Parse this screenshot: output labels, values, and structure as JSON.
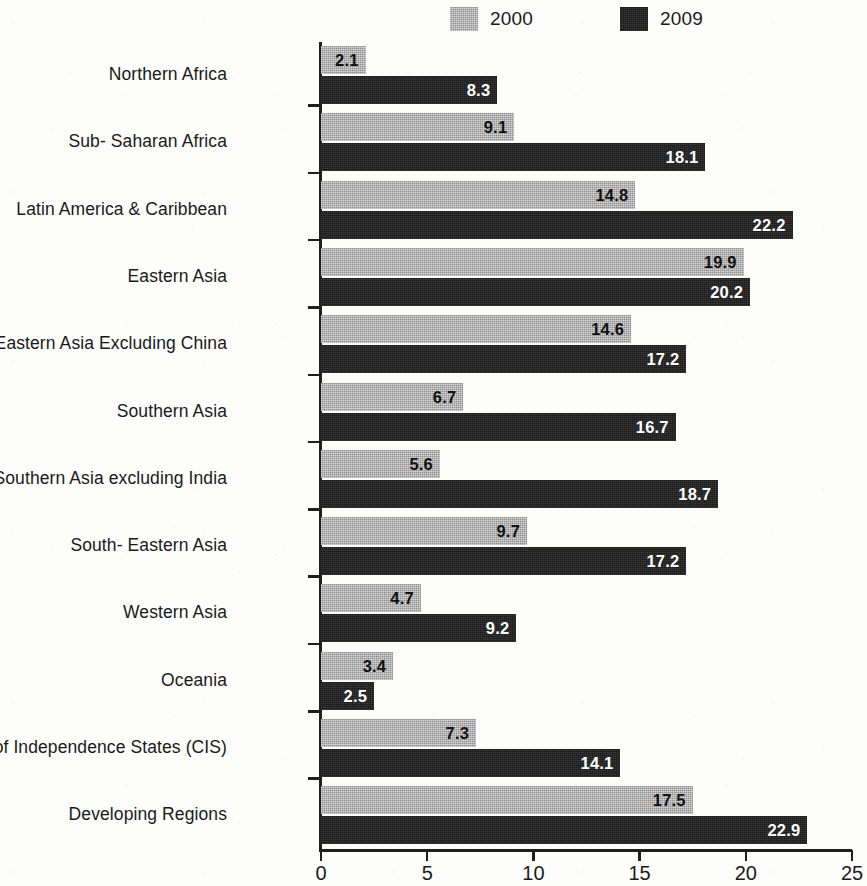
{
  "legend": {
    "items": [
      {
        "label": "2000",
        "color": "#8e8e8e",
        "key": "s2000"
      },
      {
        "label": "2009",
        "color": "#1b1b1b",
        "key": "s2009"
      }
    ]
  },
  "axis": {
    "x_ticks": [
      "0",
      "5",
      "10",
      "15",
      "20",
      "25"
    ]
  },
  "chart_data": {
    "type": "bar",
    "orientation": "horizontal",
    "title": "",
    "subtitle": "",
    "xlabel": "",
    "ylabel": "",
    "xlim": [
      0,
      25
    ],
    "xticks": [
      0,
      5,
      10,
      15,
      20,
      25
    ],
    "grid": false,
    "legend_position": "top",
    "categories": [
      "Northern Africa",
      "Sub- Saharan Africa",
      "Latin America & Caribbean",
      "Eastern Asia",
      "Eastern Asia Excluding China",
      "Southern Asia",
      "Southern Asia excluding India",
      "South- Eastern Asia",
      "Western Asia",
      "Oceania",
      "Commonwealth of Independence States (CIS)",
      "Developing Regions"
    ],
    "series": [
      {
        "name": "2000",
        "color": "#8e8e8e",
        "values": [
          2.1,
          9.1,
          14.8,
          19.9,
          14.6,
          6.7,
          5.6,
          9.7,
          4.7,
          3.4,
          7.3,
          17.5
        ]
      },
      {
        "name": "2009",
        "color": "#1b1b1b",
        "values": [
          8.3,
          18.1,
          22.2,
          20.2,
          17.2,
          16.7,
          18.7,
          17.2,
          9.2,
          2.5,
          14.1,
          22.9
        ]
      }
    ]
  }
}
